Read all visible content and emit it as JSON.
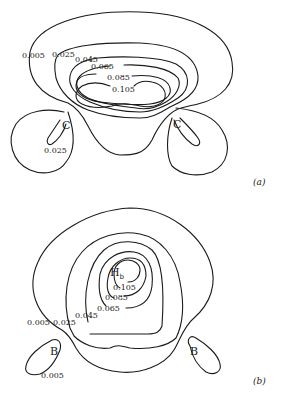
{
  "panel_a": {
    "label": "(a)",
    "atoms": [
      "C",
      "C"
    ],
    "contour_labels": [
      "0.005",
      "0.025",
      "0.045",
      "0.065",
      "0.085",
      "0.105",
      "0.025"
    ]
  },
  "panel_b": {
    "label": "(b)",
    "atom_center": "H",
    "atom_center_sub": "b",
    "atoms": [
      "B",
      "B"
    ],
    "contour_labels": [
      "0.105",
      "0.085",
      "0.065",
      "0.045",
      "0.005",
      "0.025",
      "0.005"
    ]
  }
}
